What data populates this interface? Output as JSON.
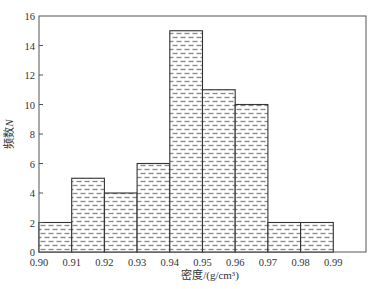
{
  "chart_data": {
    "type": "bar",
    "subtype": "histogram",
    "title": "",
    "xlabel": "密度/(g/cm³)",
    "ylabel": "频数N",
    "ylabel_prefix": "频数",
    "ylabel_var": "N",
    "bin_edges": [
      0.9,
      0.91,
      0.92,
      0.93,
      0.94,
      0.95,
      0.96,
      0.97,
      0.98,
      0.99
    ],
    "categories": [
      "0.90-0.91",
      "0.91-0.92",
      "0.92-0.93",
      "0.93-0.94",
      "0.94-0.95",
      "0.95-0.96",
      "0.96-0.97",
      "0.97-0.98",
      "0.98-0.99"
    ],
    "values": [
      2,
      5,
      4,
      6,
      15,
      11,
      10,
      2,
      2
    ],
    "xlim": [
      0.9,
      1.0
    ],
    "ylim": [
      0,
      16
    ],
    "x_tick_labels": [
      "0.90",
      "0.91",
      "0.92",
      "0.93",
      "0.94",
      "0.95",
      "0.96",
      "0.97",
      "0.98",
      "0.99"
    ],
    "y_tick_labels": [
      "0",
      "2",
      "4",
      "6",
      "8",
      "10",
      "12",
      "14",
      "16"
    ],
    "y_ticks": [
      0,
      2,
      4,
      6,
      8,
      10,
      12,
      14,
      16
    ],
    "grid": false,
    "legend": null,
    "fill": "horizontal-dash hatch",
    "colors": {
      "bar_edge": "#333333",
      "hatch": "#8a8a8a",
      "axis": "#555555",
      "background": "#ffffff"
    }
  }
}
